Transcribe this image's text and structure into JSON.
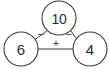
{
  "diagram": {
    "type": "fact-family-triangle",
    "background_color": "#ffffff",
    "line_color": "#3c3c3c",
    "text_color": "#2b2b2b",
    "nodes": [
      {
        "id": "top",
        "value": "10",
        "role": "whole",
        "cx": 59,
        "cy": 18,
        "r": 17
      },
      {
        "id": "left",
        "value": "6",
        "role": "part",
        "cx": 21,
        "cy": 49,
        "r": 17
      },
      {
        "id": "right",
        "value": "4",
        "role": "part",
        "cx": 90,
        "cy": 49,
        "r": 17
      }
    ],
    "edges": [
      {
        "id": "top-left",
        "from": "top",
        "to": "left",
        "operator": "−",
        "label_x": 41,
        "label_y": 34
      },
      {
        "id": "top-right",
        "from": "top",
        "to": "right",
        "operator": "−",
        "label_x": 69,
        "label_y": 34
      },
      {
        "id": "left-right",
        "from": "left",
        "to": "right",
        "operator": "+",
        "label_x": 56,
        "label_y": 43
      }
    ]
  }
}
